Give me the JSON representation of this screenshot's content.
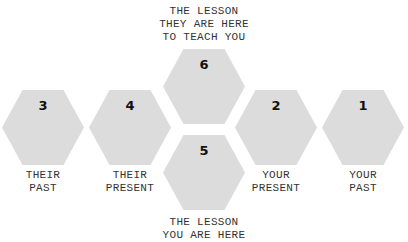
{
  "top_caption": {
    "lines": [
      "THE LESSON",
      "THEY ARE HERE",
      "TO TEACH YOU"
    ]
  },
  "bottom_caption": {
    "lines": [
      "THE LESSON",
      "YOU ARE HERE"
    ]
  },
  "hexagons": [
    {
      "number": "3",
      "label": [
        "THEIR",
        "PAST"
      ]
    },
    {
      "number": "4",
      "label": [
        "THEIR",
        "PRESENT"
      ]
    },
    {
      "number": "6",
      "label": []
    },
    {
      "number": "5",
      "label": []
    },
    {
      "number": "2",
      "label": [
        "YOUR",
        "PRESENT"
      ]
    },
    {
      "number": "1",
      "label": [
        "YOUR",
        "PAST"
      ]
    }
  ],
  "colors": {
    "hex_fill": "#dcdcdc",
    "text": "#333333",
    "number": "#111111"
  }
}
